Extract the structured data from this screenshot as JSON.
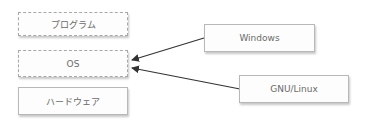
{
  "diagram": {
    "layers": [
      {
        "label": "プログラム",
        "style": "dashed"
      },
      {
        "label": "OS",
        "style": "dashed"
      },
      {
        "label": "ハードウェア",
        "style": "solid"
      }
    ],
    "operating_systems": [
      {
        "label": "Windows"
      },
      {
        "label": "GNU/Linux"
      }
    ],
    "arrows": [
      {
        "from": "Windows",
        "to": "OS"
      },
      {
        "from": "GNU/Linux",
        "to": "OS"
      }
    ],
    "colors": {
      "line": "#333333",
      "border": "#a8a8a8",
      "text": "#6a6a6a"
    }
  }
}
